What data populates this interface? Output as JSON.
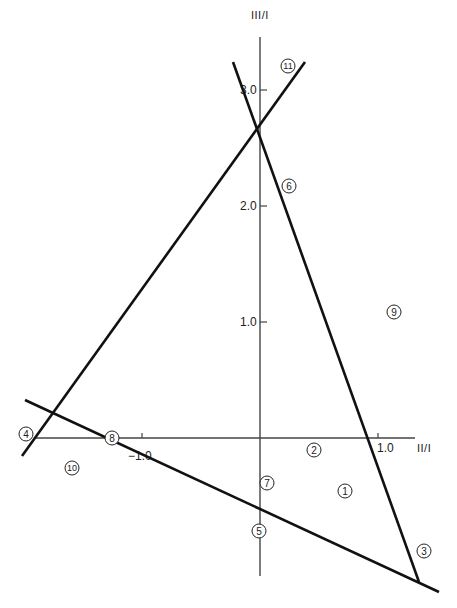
{
  "chart_data": {
    "type": "diagram",
    "title": "",
    "xlabel": "II/I",
    "ylabel": "III/I",
    "x_ticks": [
      {
        "value": -1.0,
        "label": "−1.0"
      },
      {
        "value": 1.0,
        "label": "1.0"
      }
    ],
    "y_ticks": [
      {
        "value": 1.0,
        "label": "1.0"
      },
      {
        "value": 2.0,
        "label": "2.0"
      },
      {
        "value": 3.0,
        "label": "3.0"
      }
    ],
    "xlim": [
      -2.0,
      1.4
    ],
    "ylim": [
      -1.2,
      3.4
    ],
    "lines": [
      {
        "name": "rising-line",
        "from": [
          -2.02,
          0.22
        ],
        "to": [
          0.38,
          3.23
        ]
      },
      {
        "name": "steep-falling-line",
        "from": [
          -0.23,
          3.23
        ],
        "to": [
          1.35,
          -1.24
        ]
      },
      {
        "name": "shallow-falling-line",
        "from": [
          -2.0,
          0.33
        ],
        "to": [
          1.52,
          -1.33
        ]
      }
    ],
    "regions": [
      {
        "label": "1",
        "glyph": "①",
        "x": 0.61,
        "y": -0.64
      },
      {
        "label": "2",
        "glyph": "②",
        "x": 0.45,
        "y": -0.13
      },
      {
        "label": "3",
        "glyph": "③",
        "x": 1.27,
        "y": -1.19
      },
      {
        "label": "4",
        "glyph": "④",
        "x": -2.04,
        "y": 0.03
      },
      {
        "label": "5",
        "glyph": "⑤",
        "x": -0.01,
        "y": -0.87
      },
      {
        "label": "6",
        "glyph": "⑥",
        "x": 0.25,
        "y": 2.19
      },
      {
        "label": "7",
        "glyph": "⑦",
        "x": 0.06,
        "y": -0.43
      },
      {
        "label": "8",
        "glyph": "⑧",
        "x": -1.26,
        "y": 0.03
      },
      {
        "label": "9",
        "glyph": "⑨",
        "x": 1.14,
        "y": 1.06
      },
      {
        "label": "10",
        "glyph": "⑩",
        "x": -1.61,
        "y": -0.26
      },
      {
        "label": "11",
        "glyph": "⑪",
        "x": 0.24,
        "y": 3.21
      }
    ]
  },
  "axes": {
    "x_label": "II/I",
    "y_label": "III/I",
    "x_tick_neg1": "−1.0",
    "x_tick_pos1": "1.0",
    "y_tick_1": "1.0",
    "y_tick_2": "2.0",
    "y_tick_3": "3.0"
  },
  "markers": {
    "m1": "1",
    "m2": "2",
    "m3": "3",
    "m4": "4",
    "m5": "5",
    "m6": "6",
    "m7": "7",
    "m8": "8",
    "m9": "9",
    "m10": "10",
    "m11": "11"
  }
}
